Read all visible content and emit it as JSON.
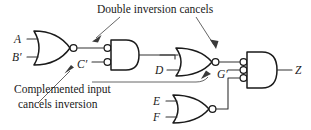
{
  "figure": {
    "background_color": "#ffffff",
    "line_color": "#1a1a1a"
  },
  "signals": {
    "a": "A",
    "b_not": "B′",
    "c_not": "C′",
    "d": "D",
    "g_not": "G′",
    "e": "E",
    "f": "F",
    "z": "Z"
  },
  "annotations": {
    "double_inversion": "Double inversion cancels",
    "complemented_line1": "Complemented input",
    "complemented_line2": "cancels inversion"
  },
  "gates": [
    {
      "id": "gate-nor-1",
      "type": "NOR",
      "inputs": [
        "A",
        "B′"
      ],
      "output": "C′",
      "output_bubble": true,
      "input_bubbles": 0
    },
    {
      "id": "gate-and-2",
      "type": "AND with inverted inputs",
      "inputs": [
        "C′",
        "C′"
      ],
      "output": "",
      "output_bubble": false,
      "input_bubbles": 2
    },
    {
      "id": "gate-nor-3",
      "type": "NOR",
      "inputs": [
        "",
        "D"
      ],
      "output": "G′",
      "output_bubble": true,
      "input_bubbles": 0
    },
    {
      "id": "gate-nor-4",
      "type": "NOR",
      "inputs": [
        "E",
        "F"
      ],
      "output": "",
      "output_bubble": true,
      "input_bubbles": 0
    },
    {
      "id": "gate-and-5",
      "type": "AND with inverted inputs",
      "inputs": [
        "G′",
        "",
        ""
      ],
      "output": "Z",
      "output_bubble": false,
      "input_bubbles": 3
    }
  ]
}
